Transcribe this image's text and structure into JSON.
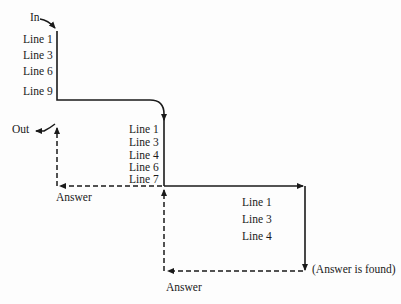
{
  "labels": {
    "in": "In",
    "out": "Out",
    "answer_1": "Answer",
    "answer_2": "Answer",
    "answer_found": "(Answer is found)"
  },
  "levels": [
    {
      "name": "level-1",
      "lines": [
        "Line 1",
        "Line 3",
        "Line 6",
        "Line 9"
      ]
    },
    {
      "name": "level-2",
      "lines": [
        "Line 1",
        "Line 3",
        "Line 4",
        "Line 6",
        "Line 7"
      ]
    },
    {
      "name": "level-3",
      "lines": [
        "Line 1",
        "Line 3",
        "Line 4"
      ]
    }
  ],
  "colors": {
    "ink": "#1a1a1a",
    "background": "#fdfdfd"
  }
}
